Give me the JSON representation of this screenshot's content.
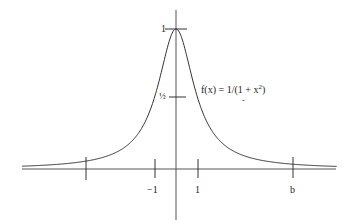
{
  "chart_data": {
    "type": "line",
    "title": "",
    "function_label": "f(x) = 1/(1 + x²)",
    "xlabel": "",
    "ylabel": "",
    "x_tick_labels": [
      "-1",
      "1",
      "b"
    ],
    "y_tick_labels": [
      "1",
      "½"
    ],
    "unlabeled_x_tick": -4,
    "b_value_approx": 5.3,
    "xlim": [
      -7,
      7.3
    ],
    "ylim": [
      0,
      1
    ],
    "grid": false,
    "legend": "none",
    "series": [
      {
        "name": "f(x) = 1/(1 + x²)",
        "x": [
          -7,
          -5,
          -4,
          -3,
          -2,
          -1,
          -0.5,
          0,
          0.5,
          1,
          2,
          3,
          4,
          5,
          5.3,
          7.3
        ],
        "y": [
          0.02,
          0.038,
          0.059,
          0.1,
          0.2,
          0.5,
          0.8,
          1,
          0.8,
          0.5,
          0.2,
          0.1,
          0.059,
          0.038,
          0.034,
          0.018
        ]
      }
    ]
  },
  "labels": {
    "y_one": "1",
    "y_half": "½",
    "x_neg_one": "−1",
    "x_one": "1",
    "x_b": "b",
    "formula_prefix": "f(x) = 1/(1 + x",
    "formula_exp": "2",
    "formula_suffix": ")",
    "formula_mark": "-"
  },
  "colors": {
    "curve": "#333333",
    "axis": "#555555",
    "text": "#222222"
  }
}
